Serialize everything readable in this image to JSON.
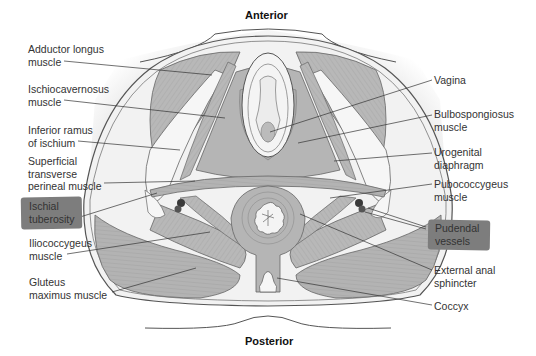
{
  "figure": {
    "orientation_top": "Anterior",
    "orientation_bottom": "Posterior",
    "colors": {
      "background": "#ffffff",
      "skin_shadow": "#e6e6e6",
      "pelvis_fill": "#f0f0f0",
      "muscle": "#b5b5b5",
      "muscle_dark": "#9c9c9c",
      "bone": "#f4f4f4",
      "outline": "#555555",
      "highlight_box": "#7d7d7d",
      "vessel": "#3a3a3a"
    },
    "left_labels": [
      {
        "id": "adductor-longus",
        "text": "Adductor longus\nmuscle",
        "highlighted": false
      },
      {
        "id": "ischiocavernosus",
        "text": "Ischiocavernosus\nmuscle",
        "highlighted": false
      },
      {
        "id": "inferior-ramus",
        "text": "Inferior ramus\nof ischium",
        "highlighted": false
      },
      {
        "id": "superficial-transverse",
        "text": "Superficial\ntransverse\nperineal muscle",
        "highlighted": false
      },
      {
        "id": "ischial-tuberosity",
        "text": "Ischial\ntuberosity",
        "highlighted": true
      },
      {
        "id": "iliococcygeus",
        "text": "Iliococcygeus\nmuscle",
        "highlighted": false
      },
      {
        "id": "gluteus-maximus",
        "text": "Gluteus\nmaximus muscle",
        "highlighted": false
      }
    ],
    "right_labels": [
      {
        "id": "vagina",
        "text": "Vagina",
        "highlighted": false
      },
      {
        "id": "bulbospongiosus",
        "text": "Bulbospongiosus\nmuscle",
        "highlighted": false
      },
      {
        "id": "urogenital-diaphragm",
        "text": "Urogenital\ndiaphragm",
        "highlighted": false
      },
      {
        "id": "pubococcygeus",
        "text": "Pubococcygeus\nmuscle",
        "highlighted": false
      },
      {
        "id": "pudendal-vessels",
        "text": "Pudendal\nvessels",
        "highlighted": true
      },
      {
        "id": "external-anal-sphincter",
        "text": "External anal\nsphincter",
        "highlighted": false
      },
      {
        "id": "coccyx",
        "text": "Coccyx",
        "highlighted": false
      }
    ]
  }
}
